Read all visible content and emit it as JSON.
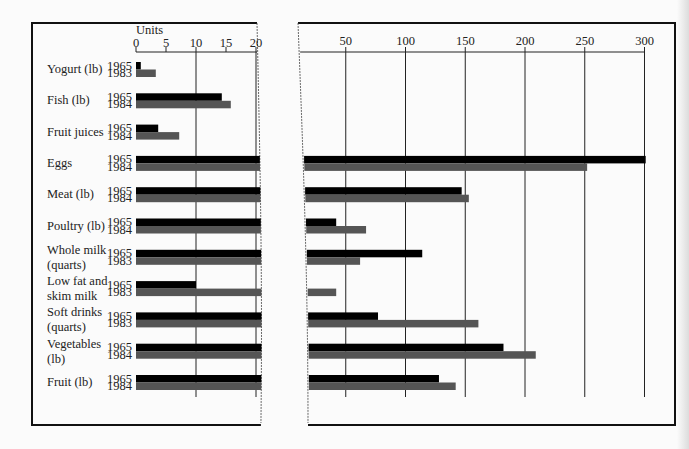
{
  "chart_data": {
    "type": "bar",
    "orientation": "horizontal",
    "broken_axis": true,
    "title": "",
    "xlabel": "Units",
    "ylabel": "",
    "colors": {
      "first_year": "#000000",
      "second_year": "#555555",
      "grid": "#222222",
      "frame": "#111111"
    },
    "axes": [
      {
        "name": "left",
        "range": [
          0,
          21
        ],
        "ticks": [
          0,
          5,
          10,
          15,
          20
        ],
        "tick_labels": [
          "0",
          "5",
          "10",
          "15",
          "20"
        ]
      },
      {
        "name": "right",
        "range": [
          0,
          325
        ],
        "ticks": [
          50,
          100,
          150,
          200,
          250,
          300
        ],
        "tick_labels": [
          "50",
          "100",
          "150",
          "200",
          "250",
          "300"
        ]
      }
    ],
    "categories": [
      {
        "label": [
          "Yogurt (lb)"
        ],
        "years": [
          "1965",
          "1983"
        ],
        "values": [
          0.8,
          3.3
        ]
      },
      {
        "label": [
          "Fish (lb)"
        ],
        "years": [
          "1965",
          "1984"
        ],
        "values": [
          14.3,
          15.8
        ]
      },
      {
        "label": [
          "Fruit juices"
        ],
        "years": [
          "1965",
          "1984"
        ],
        "values": [
          3.7,
          7.2
        ]
      },
      {
        "label": [
          "Eggs"
        ],
        "years": [
          "1965",
          "1984"
        ],
        "values": [
          301,
          252
        ]
      },
      {
        "label": [
          "Meat (lb)"
        ],
        "years": [
          "1965",
          "1984"
        ],
        "values": [
          147,
          153
        ]
      },
      {
        "label": [
          "Poultry (lb)"
        ],
        "years": [
          "1965",
          "1984"
        ],
        "values": [
          42,
          67
        ]
      },
      {
        "label": [
          "Whole milk",
          "(quarts)"
        ],
        "years": [
          "1965",
          "1983"
        ],
        "values": [
          114,
          62
        ]
      },
      {
        "label": [
          "Low fat and",
          "skim milk"
        ],
        "years": [
          "1965",
          "1983"
        ],
        "values": [
          10,
          42
        ]
      },
      {
        "label": [
          "Soft drinks",
          "(quarts)"
        ],
        "years": [
          "1965",
          "1983"
        ],
        "values": [
          77,
          161
        ]
      },
      {
        "label": [
          "Vegetables",
          "(lb)"
        ],
        "years": [
          "1965",
          "1984"
        ],
        "values": [
          182,
          209
        ]
      },
      {
        "label": [
          "Fruit (lb)"
        ],
        "years": [
          "1965",
          "1984"
        ],
        "values": [
          128,
          142
        ]
      }
    ],
    "grid": true,
    "legend": "none"
  }
}
